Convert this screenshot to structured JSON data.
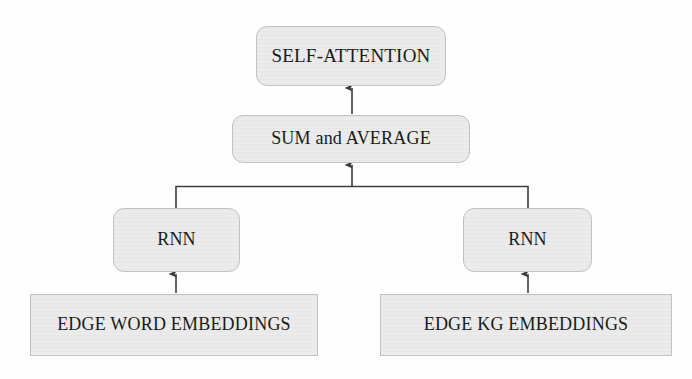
{
  "diagram": {
    "background_color": "#fefefe",
    "node_fill_color": "#e9e9e9",
    "node_border_color": "#c2c2c2",
    "connector_color": "#3c3c3c",
    "text_color": "#1a1a1a",
    "nodes": [
      {
        "id": "self_attention",
        "label": "SELF-ATTENTION",
        "shape": "rounded-rectangle",
        "level": "output"
      },
      {
        "id": "sum_average",
        "label": "SUM and AVERAGE",
        "shape": "rounded-rectangle",
        "level": "aggregation"
      },
      {
        "id": "rnn_left",
        "label": "RNN",
        "shape": "rounded-rectangle",
        "level": "encoder"
      },
      {
        "id": "rnn_right",
        "label": "RNN",
        "shape": "rounded-rectangle",
        "level": "encoder"
      },
      {
        "id": "edge_word_embeddings",
        "label": "EDGE WORD EMBEDDINGS",
        "shape": "rectangle",
        "level": "input"
      },
      {
        "id": "edge_kg_embeddings",
        "label": "EDGE KG EMBEDDINGS",
        "shape": "rectangle",
        "level": "input"
      }
    ],
    "edges": [
      {
        "from": "sum_average",
        "to": "self_attention",
        "style": "arrow-up"
      },
      {
        "from": "rnn_left",
        "to": "sum_average",
        "style": "bracket-merge-arrow-up"
      },
      {
        "from": "rnn_right",
        "to": "sum_average",
        "style": "bracket-merge-arrow-up"
      },
      {
        "from": "edge_word_embeddings",
        "to": "rnn_left",
        "style": "arrow-up"
      },
      {
        "from": "edge_kg_embeddings",
        "to": "rnn_right",
        "style": "arrow-up"
      }
    ]
  }
}
